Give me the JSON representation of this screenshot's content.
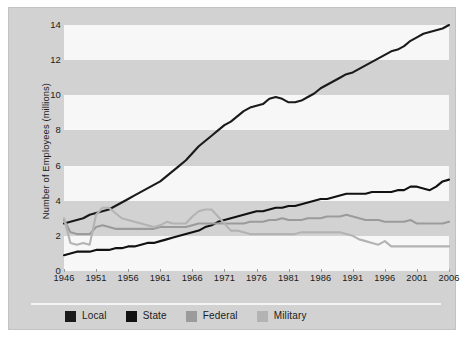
{
  "chart_data": {
    "type": "line",
    "title": "",
    "xlabel": "",
    "ylabel": "Number of Employees (millions)",
    "xlim": [
      1946,
      2006
    ],
    "ylim": [
      0,
      14
    ],
    "yticks": [
      0,
      2,
      4,
      6,
      8,
      10,
      12,
      14
    ],
    "xticks": [
      1946,
      1951,
      1956,
      1961,
      1966,
      1971,
      1976,
      1981,
      1986,
      1991,
      1996,
      2001,
      2006
    ],
    "grid": "alternating horizontal bands",
    "legend_position": "bottom-left",
    "series": [
      {
        "name": "Local",
        "color": "#1a1a1a",
        "x": [
          1946,
          1947,
          1948,
          1949,
          1950,
          1951,
          1952,
          1953,
          1954,
          1955,
          1956,
          1957,
          1958,
          1959,
          1960,
          1961,
          1962,
          1963,
          1964,
          1965,
          1966,
          1967,
          1968,
          1969,
          1970,
          1971,
          1972,
          1973,
          1974,
          1975,
          1976,
          1977,
          1978,
          1979,
          1980,
          1981,
          1982,
          1983,
          1984,
          1985,
          1986,
          1987,
          1988,
          1989,
          1990,
          1991,
          1992,
          1993,
          1994,
          1995,
          1996,
          1997,
          1998,
          1999,
          2000,
          2001,
          2002,
          2003,
          2004,
          2005,
          2006
        ],
        "values": [
          2.7,
          2.8,
          2.9,
          3.0,
          3.2,
          3.3,
          3.4,
          3.5,
          3.7,
          3.9,
          4.1,
          4.3,
          4.5,
          4.7,
          4.9,
          5.1,
          5.4,
          5.7,
          6.0,
          6.3,
          6.7,
          7.1,
          7.4,
          7.7,
          8.0,
          8.3,
          8.5,
          8.8,
          9.1,
          9.3,
          9.4,
          9.5,
          9.8,
          9.9,
          9.8,
          9.6,
          9.6,
          9.7,
          9.9,
          10.1,
          10.4,
          10.6,
          10.8,
          11.0,
          11.2,
          11.3,
          11.5,
          11.7,
          11.9,
          12.1,
          12.3,
          12.5,
          12.6,
          12.8,
          13.1,
          13.3,
          13.5,
          13.6,
          13.7,
          13.8,
          14.0
        ]
      },
      {
        "name": "State",
        "color": "#111111",
        "x": [
          1946,
          1947,
          1948,
          1949,
          1950,
          1951,
          1952,
          1953,
          1954,
          1955,
          1956,
          1957,
          1958,
          1959,
          1960,
          1961,
          1962,
          1963,
          1964,
          1965,
          1966,
          1967,
          1968,
          1969,
          1970,
          1971,
          1972,
          1973,
          1974,
          1975,
          1976,
          1977,
          1978,
          1979,
          1980,
          1981,
          1982,
          1983,
          1984,
          1985,
          1986,
          1987,
          1988,
          1989,
          1990,
          1991,
          1992,
          1993,
          1994,
          1995,
          1996,
          1997,
          1998,
          1999,
          2000,
          2001,
          2002,
          2003,
          2004,
          2005,
          2006
        ],
        "values": [
          0.9,
          1.0,
          1.1,
          1.1,
          1.1,
          1.2,
          1.2,
          1.2,
          1.3,
          1.3,
          1.4,
          1.4,
          1.5,
          1.6,
          1.6,
          1.7,
          1.8,
          1.9,
          2.0,
          2.1,
          2.2,
          2.3,
          2.5,
          2.6,
          2.8,
          2.9,
          3.0,
          3.1,
          3.2,
          3.3,
          3.4,
          3.4,
          3.5,
          3.6,
          3.6,
          3.7,
          3.7,
          3.8,
          3.9,
          4.0,
          4.1,
          4.1,
          4.2,
          4.3,
          4.4,
          4.4,
          4.4,
          4.4,
          4.5,
          4.5,
          4.5,
          4.5,
          4.6,
          4.6,
          4.8,
          4.8,
          4.7,
          4.6,
          4.8,
          5.1,
          5.2
        ]
      },
      {
        "name": "Federal",
        "color": "#9b9b9b",
        "x": [
          1946,
          1947,
          1948,
          1949,
          1950,
          1951,
          1952,
          1953,
          1954,
          1955,
          1956,
          1957,
          1958,
          1959,
          1960,
          1961,
          1962,
          1963,
          1964,
          1965,
          1966,
          1967,
          1968,
          1969,
          1970,
          1971,
          1972,
          1973,
          1974,
          1975,
          1976,
          1977,
          1978,
          1979,
          1980,
          1981,
          1982,
          1983,
          1984,
          1985,
          1986,
          1987,
          1988,
          1989,
          1990,
          1991,
          1992,
          1993,
          1994,
          1995,
          1996,
          1997,
          1998,
          1999,
          2000,
          2001,
          2002,
          2003,
          2004,
          2005,
          2006
        ],
        "values": [
          2.9,
          2.2,
          2.1,
          2.1,
          2.1,
          2.5,
          2.6,
          2.5,
          2.4,
          2.4,
          2.4,
          2.4,
          2.4,
          2.4,
          2.4,
          2.5,
          2.5,
          2.5,
          2.5,
          2.5,
          2.6,
          2.7,
          2.7,
          2.7,
          2.7,
          2.7,
          2.7,
          2.7,
          2.7,
          2.8,
          2.8,
          2.8,
          2.9,
          2.9,
          3.0,
          2.9,
          2.9,
          2.9,
          3.0,
          3.0,
          3.0,
          3.1,
          3.1,
          3.1,
          3.2,
          3.1,
          3.0,
          2.9,
          2.9,
          2.9,
          2.8,
          2.8,
          2.8,
          2.8,
          2.9,
          2.7,
          2.7,
          2.7,
          2.7,
          2.7,
          2.8
        ]
      },
      {
        "name": "Military",
        "color": "#b3b3b3",
        "x": [
          1946,
          1947,
          1948,
          1949,
          1950,
          1951,
          1952,
          1953,
          1954,
          1955,
          1956,
          1957,
          1958,
          1959,
          1960,
          1961,
          1962,
          1963,
          1964,
          1965,
          1966,
          1967,
          1968,
          1969,
          1970,
          1971,
          1972,
          1973,
          1974,
          1975,
          1976,
          1977,
          1978,
          1979,
          1980,
          1981,
          1982,
          1983,
          1984,
          1985,
          1986,
          1987,
          1988,
          1989,
          1990,
          1991,
          1992,
          1993,
          1994,
          1995,
          1996,
          1997,
          1998,
          1999,
          2000,
          2001,
          2002,
          2003,
          2004,
          2005,
          2006
        ],
        "values": [
          3.0,
          1.6,
          1.5,
          1.6,
          1.5,
          3.2,
          3.6,
          3.6,
          3.3,
          3.0,
          2.9,
          2.8,
          2.7,
          2.6,
          2.5,
          2.6,
          2.8,
          2.7,
          2.7,
          2.7,
          3.1,
          3.4,
          3.5,
          3.5,
          3.1,
          2.7,
          2.3,
          2.3,
          2.2,
          2.1,
          2.1,
          2.1,
          2.1,
          2.1,
          2.1,
          2.1,
          2.1,
          2.2,
          2.2,
          2.2,
          2.2,
          2.2,
          2.2,
          2.2,
          2.1,
          2.0,
          1.8,
          1.7,
          1.6,
          1.5,
          1.7,
          1.4,
          1.4,
          1.4,
          1.4,
          1.4,
          1.4,
          1.4,
          1.4,
          1.4,
          1.4
        ]
      }
    ]
  },
  "axes": {
    "ylabel": "Number of Employees (millions)",
    "yticks": [
      "14",
      "12",
      "10",
      "8",
      "6",
      "4",
      "2",
      "0"
    ],
    "xticks": [
      "1946",
      "1951",
      "1956",
      "1961",
      "1966",
      "1971",
      "1976",
      "1981",
      "1986",
      "1991",
      "1996",
      "2001",
      "2006"
    ]
  },
  "legend": {
    "items": [
      {
        "label": "Local",
        "color": "#1a1a1a"
      },
      {
        "label": "State",
        "color": "#111111"
      },
      {
        "label": "Federal",
        "color": "#9b9b9b"
      },
      {
        "label": "Military",
        "color": "#b3b3b3"
      }
    ]
  },
  "colors": {
    "panel_background": "#d2d2d2",
    "band_white": "#f7f7f7",
    "page_background": "#ffffff",
    "text": "#1a1a1a"
  }
}
